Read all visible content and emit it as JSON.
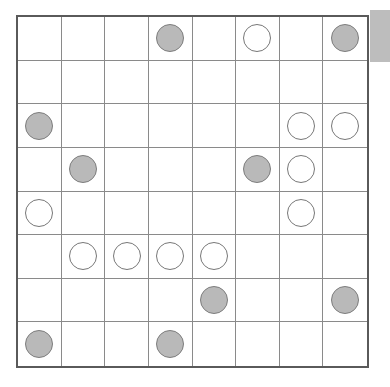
{
  "app": {
    "title": "Othello / Reversi Board",
    "description": "8x8 game board grid with gray and white round pieces"
  },
  "board": {
    "rows": 8,
    "cols": 8,
    "column_labels": [
      "1",
      "2",
      "3",
      "4",
      "5",
      "6",
      "7",
      "8"
    ],
    "row_labels": [
      "1",
      "2",
      "3",
      "4",
      "5",
      "6",
      "7",
      "8"
    ],
    "cell_size_px": 44,
    "piece_diameter_px": 28,
    "gray_piece_count": 10,
    "white_piece_count": 10,
    "empty_cell_count": 44,
    "cells": [
      [
        "empty",
        "empty",
        "empty",
        "gray",
        "empty",
        "white",
        "empty",
        "gray"
      ],
      [
        "empty",
        "empty",
        "empty",
        "empty",
        "empty",
        "empty",
        "empty",
        "empty"
      ],
      [
        "gray",
        "empty",
        "empty",
        "empty",
        "empty",
        "empty",
        "white",
        "white"
      ],
      [
        "empty",
        "gray",
        "empty",
        "empty",
        "empty",
        "gray",
        "white",
        "empty"
      ],
      [
        "white",
        "empty",
        "empty",
        "empty",
        "empty",
        "empty",
        "white",
        "empty"
      ],
      [
        "empty",
        "white",
        "white",
        "white",
        "white",
        "empty",
        "empty",
        "empty"
      ],
      [
        "empty",
        "empty",
        "empty",
        "empty",
        "gray",
        "empty",
        "empty",
        "gray"
      ],
      [
        "gray",
        "empty",
        "empty",
        "gray",
        "empty",
        "empty",
        "empty",
        "empty"
      ]
    ]
  },
  "colors": {
    "page_background": "#ffffff",
    "board_background": "#ffffff",
    "board_border": "#5a5a5a",
    "grid_line": "#8a8a8a",
    "gray_piece_fill": "#b9b9b9",
    "gray_piece_stroke": "#7d7d7d",
    "white_piece_fill": "#ffffff",
    "white_piece_stroke": "#777777",
    "side_tab": "#bdbdbd"
  },
  "side_tab": {
    "label": ""
  }
}
